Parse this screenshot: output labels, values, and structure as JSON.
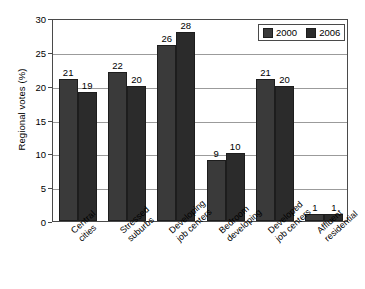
{
  "chart_data": {
    "type": "bar",
    "title": "",
    "subtitle": "",
    "xlabel": "",
    "ylabel": "Regional votes (%)",
    "ylim": [
      0,
      30
    ],
    "yticks": [
      0,
      5,
      10,
      15,
      20,
      25,
      30
    ],
    "ytick_labels": [
      "0",
      "5",
      "10",
      "15",
      "20",
      "25",
      "30"
    ],
    "grid": true,
    "legend_position": "top-right",
    "categories": [
      "Central cities",
      "Stressed suburbs",
      "Developing job centers",
      "Bedroom developing",
      "Developed job centers",
      "Affluent residential"
    ],
    "category_lines": [
      [
        "Central",
        "cities"
      ],
      [
        "Stressed",
        "suburbs"
      ],
      [
        "Developing",
        "job centers"
      ],
      [
        "Bedroom",
        "developing"
      ],
      [
        "Developed",
        "job centers"
      ],
      [
        "Affluent",
        "residential"
      ]
    ],
    "series": [
      {
        "name": "2000",
        "color": "#3a3a3a",
        "values": [
          21,
          22,
          26,
          9,
          21,
          1
        ],
        "value_labels": [
          "21",
          "22",
          "26",
          "9",
          "21",
          "1"
        ]
      },
      {
        "name": "2006",
        "color": "#2b2b2b",
        "values": [
          19,
          20,
          28,
          10,
          20,
          1
        ],
        "value_labels": [
          "19",
          "20",
          "28",
          "10",
          "20",
          "1"
        ]
      }
    ]
  },
  "legend": {
    "items": [
      {
        "label": "2000",
        "color": "#3a3a3a"
      },
      {
        "label": "2006",
        "color": "#2b2b2b"
      }
    ]
  },
  "axis": {
    "y_title": "Regional votes (%)"
  }
}
